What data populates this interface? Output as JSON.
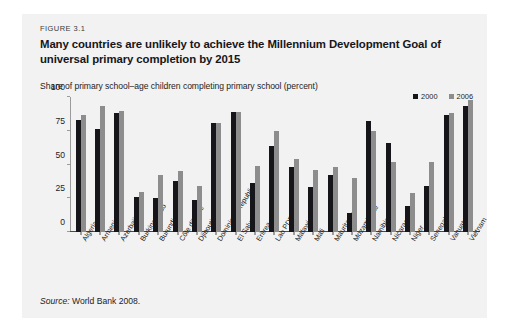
{
  "figure": {
    "number": "FIGURE 3.1",
    "title": "Many countries are unlikely to achieve the Millennium Development Goal of universal primary completion by 2015",
    "source_prefix": "Source:",
    "source_text": " World Bank 2008."
  },
  "chart_data": {
    "type": "bar",
    "title": "Many countries are unlikely to achieve the Millennium Development Goal of universal primary completion by 2015",
    "subtitle": "Share of primary school–age children completing primary school (percent)",
    "xlabel": "",
    "ylabel": "Share of primary school–age children completing primary school (percent)",
    "ylim": [
      0,
      100
    ],
    "yticks": [
      0,
      25,
      50,
      75,
      100
    ],
    "grid": false,
    "legend_position": "top-right",
    "categories": [
      "Algeria",
      "Armenia",
      "Azerbaijan",
      "Burkina Faso",
      "Burundi",
      "Côte d'Ivoire",
      "Djibouti",
      "Dominican Republic",
      "El Salvador",
      "Eritrea",
      "Lao PDR",
      "Malawi",
      "Mali",
      "Mauritania",
      "Mozambique",
      "Namibia",
      "Nicaragua",
      "Niger",
      "Senegal",
      "Vanuatu",
      "Vietnam"
    ],
    "series": [
      {
        "name": "2000",
        "color": "#16161a",
        "values": [
          83,
          76,
          88,
          26,
          25,
          38,
          24,
          81,
          89,
          36,
          64,
          48,
          33,
          42,
          14,
          82,
          66,
          19,
          34,
          87,
          93
        ]
      },
      {
        "name": "2006",
        "color": "#8d8d8d",
        "values": [
          87,
          93,
          90,
          30,
          42,
          45,
          34,
          81,
          89,
          49,
          75,
          54,
          46,
          48,
          40,
          75,
          52,
          29,
          52,
          88,
          98
        ]
      }
    ]
  }
}
